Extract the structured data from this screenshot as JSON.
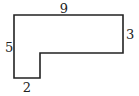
{
  "diagram": {
    "type": "l-shaped-polygon",
    "stroke_color": "#222222",
    "background": "#ffffff",
    "labels": {
      "top": "9",
      "right": "3",
      "left": "5",
      "bottom": "2"
    },
    "side_lengths": {
      "top": 9,
      "right": 3,
      "left": 5,
      "bottom": 2
    }
  }
}
